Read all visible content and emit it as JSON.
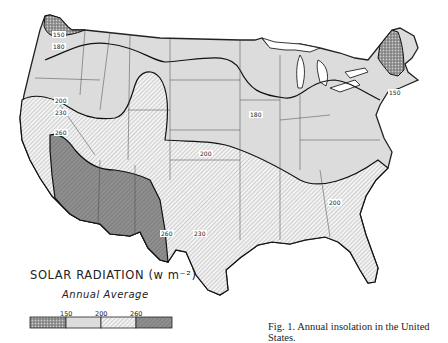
{
  "figure": {
    "caption": "Fig. 1. Annual insolation in the United States."
  },
  "legend": {
    "title": "SOLAR RADIATION (w m⁻²)",
    "subtitle": "Annual Average",
    "ticks": [
      "150",
      "200",
      "260"
    ],
    "classes": [
      {
        "range": "<150",
        "pattern": "stippled-dark",
        "color": "#8a8a8a"
      },
      {
        "range": "150-200",
        "pattern": "light-gray",
        "color": "#dcdcdc"
      },
      {
        "range": "200-260",
        "pattern": "diagonal-hatch",
        "color": "#eeeeee"
      },
      {
        "range": ">260",
        "pattern": "dark-gray",
        "color": "#8c8c8c"
      }
    ]
  },
  "contours": {
    "labels": [
      {
        "value": "150",
        "location": "northwest-washington"
      },
      {
        "value": "180",
        "location": "washington-oregon"
      },
      {
        "value": "150",
        "location": "new-england"
      },
      {
        "value": "180",
        "location": "iowa-illinois"
      },
      {
        "value": "200",
        "location": "california-north"
      },
      {
        "value": "230",
        "location": "california-mid"
      },
      {
        "value": "260",
        "location": "california-south"
      },
      {
        "value": "200",
        "location": "colorado-kansas"
      },
      {
        "value": "260",
        "location": "west-texas"
      },
      {
        "value": "230",
        "location": "central-texas"
      },
      {
        "value": "200",
        "location": "georgia-carolina"
      },
      {
        "value": "230",
        "location": "florida"
      }
    ]
  }
}
